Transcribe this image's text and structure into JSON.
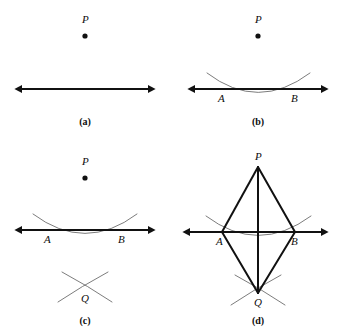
{
  "figure": {
    "background_color": "#ffffff",
    "line_color": "#111111",
    "arc_color": "#6d6d6d",
    "label_color": "#0d0d0d"
  },
  "panels": [
    {
      "id": "a",
      "caption": "(a)",
      "caption_x": 85,
      "caption_y": 117,
      "points": [
        {
          "name": "P",
          "label": "P",
          "x": 85,
          "y": 36,
          "label_x": 82,
          "label_y": 14,
          "dot": true
        }
      ],
      "baseline": {
        "x1": 22,
        "x2": 148,
        "y": 89
      },
      "arcs": [],
      "segments": []
    },
    {
      "id": "b",
      "caption": "(b)",
      "caption_x": 258,
      "caption_y": 117,
      "points": [
        {
          "name": "P",
          "label": "P",
          "x": 258,
          "y": 36,
          "label_x": 255,
          "label_y": 14,
          "dot": true
        },
        {
          "name": "A",
          "label": "A",
          "x": 222,
          "y": 89,
          "label_x": 218,
          "label_y": 93,
          "dot": false
        },
        {
          "name": "B",
          "label": "B",
          "x": 295,
          "y": 89,
          "label_x": 291,
          "label_y": 93,
          "dot": false
        }
      ],
      "baseline": {
        "x1": 195,
        "x2": 321,
        "y": 89
      },
      "arcs": [
        {
          "name": "arc-centered-at-P",
          "d": "M 207 73 Q 258 112 310 73"
        }
      ],
      "segments": []
    },
    {
      "id": "c",
      "caption": "(c)",
      "caption_x": 85,
      "caption_y": 316,
      "points": [
        {
          "name": "P",
          "label": "P",
          "x": 85,
          "y": 178,
          "label_x": 82,
          "label_y": 156,
          "dot": true
        },
        {
          "name": "A",
          "label": "A",
          "x": 48,
          "y": 230,
          "label_x": 44,
          "label_y": 234,
          "dot": false
        },
        {
          "name": "B",
          "label": "B",
          "x": 122,
          "y": 230,
          "label_x": 118,
          "label_y": 234,
          "dot": false
        },
        {
          "name": "Q",
          "label": "Q",
          "x": 85,
          "y": 290,
          "label_x": 81,
          "label_y": 293,
          "dot": false
        }
      ],
      "baseline": {
        "x1": 22,
        "x2": 148,
        "y": 230
      },
      "arcs": [
        {
          "name": "arc-centered-at-P",
          "d": "M 33 214 Q 85 253 137 214"
        },
        {
          "name": "arc-centered-at-A",
          "d": "M 62 272 Q 88 286 112 302"
        },
        {
          "name": "arc-centered-at-B",
          "d": "M 108 272 Q 82 286 58 302"
        }
      ],
      "segments": []
    },
    {
      "id": "d",
      "caption": "(d)",
      "caption_x": 258,
      "caption_y": 316,
      "points": [
        {
          "name": "P",
          "label": "P",
          "x": 258,
          "y": 167,
          "label_x": 255,
          "label_y": 151,
          "dot": false
        },
        {
          "name": "A",
          "label": "A",
          "x": 222,
          "y": 232,
          "label_x": 216,
          "label_y": 236,
          "dot": false
        },
        {
          "name": "B",
          "label": "B",
          "x": 295,
          "y": 232,
          "label_x": 291,
          "label_y": 236,
          "dot": false
        },
        {
          "name": "Q",
          "label": "Q",
          "x": 258,
          "y": 293,
          "label_x": 254,
          "label_y": 297,
          "dot": false
        }
      ],
      "baseline": {
        "x1": 190,
        "x2": 321,
        "y": 232
      },
      "arcs": [
        {
          "name": "arc-centered-at-P",
          "d": "M 206 216 Q 258 255 311 216"
        },
        {
          "name": "arc-centered-at-A",
          "d": "M 235 275 Q 261 289 285 305"
        },
        {
          "name": "arc-centered-at-B",
          "d": "M 281 275 Q 255 289 231 305"
        }
      ],
      "segments": [
        {
          "name": "segment-PA",
          "x1": 258,
          "y1": 167,
          "x2": 222,
          "y2": 232
        },
        {
          "name": "segment-PB",
          "x1": 258,
          "y1": 167,
          "x2": 295,
          "y2": 232
        },
        {
          "name": "segment-AQ",
          "x1": 222,
          "y1": 232,
          "x2": 258,
          "y2": 293
        },
        {
          "name": "segment-BQ",
          "x1": 295,
          "y1": 232,
          "x2": 258,
          "y2": 293
        },
        {
          "name": "segment-PQ",
          "x1": 258,
          "y1": 167,
          "x2": 258,
          "y2": 293
        }
      ]
    }
  ]
}
